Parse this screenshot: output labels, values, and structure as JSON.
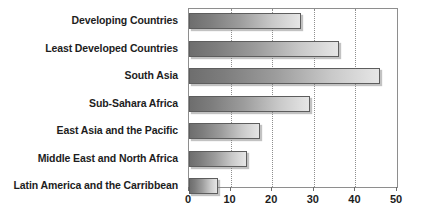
{
  "chart_data": {
    "type": "bar",
    "orientation": "horizontal",
    "title": "",
    "subtitle": "",
    "xlabel": "",
    "ylabel": "",
    "categories": [
      "Developing Countries",
      "Least Developed Countries",
      "South Asia",
      "Sub-Sahara Africa",
      "East Asia and the Pacific",
      "Middle East and North Africa",
      "Latin America and the Carribbean"
    ],
    "values": [
      27,
      36,
      46,
      29,
      17,
      14,
      7
    ],
    "xlim": [
      0,
      50
    ],
    "ylim": [
      0,
      7
    ],
    "xticks": [
      0,
      10,
      20,
      30,
      40,
      50
    ],
    "xtick_labels": [
      "0",
      "10",
      "20",
      "30",
      "40",
      "50"
    ],
    "grid": true,
    "grid_axis": "x",
    "grid_style": "dotted",
    "legend": false,
    "legend_position": "none",
    "series": [
      {
        "name": "",
        "values": [
          27,
          36,
          46,
          29,
          17,
          14,
          7
        ]
      }
    ],
    "annotations": [],
    "colors": {
      "bar_gradient_start": "#6e6e6e",
      "bar_gradient_end": "#e6e6e6",
      "bar_border": "#5d5d5d",
      "gridline": "#8e8e8e",
      "axis_line": "#8e8e8e",
      "text": "#1d1d1d",
      "background": "#ffffff"
    }
  }
}
